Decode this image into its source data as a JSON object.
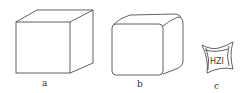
{
  "figures": [
    {
      "id": "a",
      "label": "a",
      "description": "sharp-edged cube"
    },
    {
      "id": "b",
      "label": "b",
      "description": "cube with rounded edges"
    },
    {
      "id": "c",
      "label": "c",
      "description": "small concave-sided cube with marking",
      "marking": "HZI"
    }
  ],
  "colors": {
    "stroke": "#3a3a3a",
    "background": "#ffffff"
  }
}
